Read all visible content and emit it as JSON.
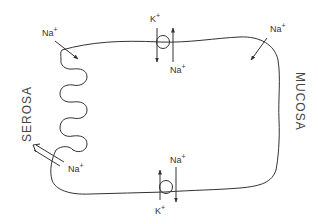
{
  "figure": {
    "type": "cell-membrane-ion-transport-schematic",
    "line_color": "#333333",
    "background": "#ffffff"
  },
  "labels": {
    "serosa": "SEROSA",
    "mucosa": "MUCOSA"
  },
  "ions": {
    "na_top_left": {
      "symbol": "Na",
      "charge": "+",
      "direction": "into cell"
    },
    "k_top_pump": {
      "symbol": "K",
      "charge": "+",
      "direction": "out of cell"
    },
    "na_top_pump": {
      "symbol": "Na",
      "charge": "+",
      "direction": "into cell"
    },
    "na_top_right": {
      "symbol": "Na",
      "charge": "+",
      "direction": "into cell"
    },
    "na_serosa": {
      "symbol": "Na",
      "charge": "+",
      "direction": "out to serosa"
    },
    "na_bottom_pump": {
      "symbol": "Na",
      "charge": "+",
      "direction": "out of cell"
    },
    "k_bottom_pump": {
      "symbol": "K",
      "charge": "+",
      "direction": "into cell"
    }
  },
  "pumps": [
    {
      "name": "top-pump",
      "position": "top membrane"
    },
    {
      "name": "bottom-pump",
      "position": "bottom membrane"
    }
  ]
}
